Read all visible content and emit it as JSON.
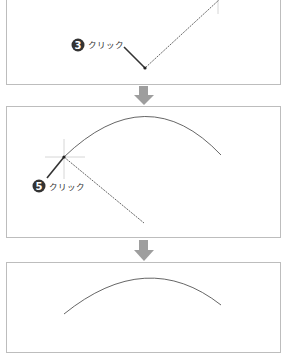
{
  "steps": [
    {
      "number": "3",
      "label": "クリック"
    },
    {
      "number": "5",
      "label": "クリック"
    }
  ],
  "colors": {
    "border": "#bdbdbd",
    "line": "#555555",
    "badge": "#333333",
    "arrow": "#9e9e9e",
    "crosshair": "#bbbbbb"
  }
}
